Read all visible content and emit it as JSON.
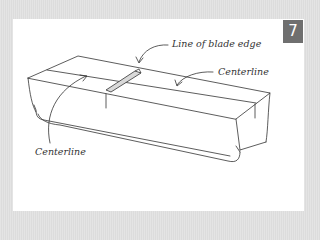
{
  "figure": {
    "number": "7",
    "labels": {
      "blade_edge": "Line of blade edge",
      "centerline_right": "Centerline",
      "centerline_left": "Centerline"
    }
  },
  "colors": {
    "background": "#e0e0e0",
    "panel": "#ffffff",
    "badge": "#6f6f6f",
    "ink": "#333333",
    "blade": "#d9d9d9"
  }
}
